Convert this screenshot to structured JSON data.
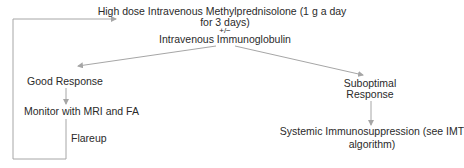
{
  "diagram": {
    "colors": {
      "line": "#a6a6a6",
      "text": "#2a2a2a",
      "background": "#ffffff"
    },
    "nodes": {
      "treatment": {
        "line1": "High dose Intravenous Methylprednisolone (1 g a day",
        "line2": "for 3 days)",
        "connector": "+/−",
        "line3": "Intravenous Immunoglobulin"
      },
      "good_response": {
        "label": "Good Response"
      },
      "monitor": {
        "label": "Monitor with MRI and FA"
      },
      "flareup": {
        "label": "Flareup"
      },
      "suboptimal_response": {
        "line1": "Suboptimal",
        "line2": "Response"
      },
      "systemic": {
        "line1": "Systemic Immunosuppression (see IMT",
        "line2": "algorithm)"
      }
    },
    "edges": [
      {
        "from": "treatment",
        "to": "good_response"
      },
      {
        "from": "treatment",
        "to": "suboptimal_response"
      },
      {
        "from": "good_response",
        "to": "monitor"
      },
      {
        "from": "monitor",
        "to": "treatment",
        "label": "Flareup"
      },
      {
        "from": "suboptimal_response",
        "to": "systemic"
      }
    ]
  }
}
